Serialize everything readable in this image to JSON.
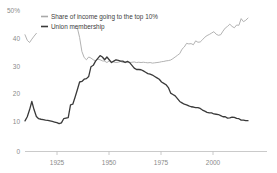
{
  "chart_data": {
    "type": "line",
    "title": "",
    "subtitle": "",
    "xlabel": "",
    "ylabel": "",
    "xlim": [
      1917,
      2015
    ],
    "ylim": [
      0,
      50
    ],
    "grid": false,
    "legend_position": "top-left",
    "y_ticks": [
      {
        "value": 50,
        "label": "50%"
      },
      {
        "value": 40,
        "label": "40"
      },
      {
        "value": 30,
        "label": "30"
      },
      {
        "value": 20,
        "label": "20"
      },
      {
        "value": 10,
        "label": "10"
      },
      {
        "value": 0,
        "label": "0"
      }
    ],
    "x_ticks": [
      {
        "value": 1925,
        "label": "1925"
      },
      {
        "value": 1950,
        "label": "1950"
      },
      {
        "value": 1975,
        "label": "1975"
      },
      {
        "value": 2000,
        "label": "2000"
      }
    ],
    "series": [
      {
        "name": "Share of income going to the top 10%",
        "color": "#a9a9a9",
        "x": [
          1917,
          1918,
          1919,
          1920,
          1921,
          1922,
          1940,
          1941,
          1942,
          1943,
          1944,
          1945,
          1946,
          1947,
          1948,
          1949,
          1950,
          1951,
          1952,
          1953,
          1954,
          1955,
          1956,
          1957,
          1958,
          1959,
          1960,
          1961,
          1962,
          1963,
          1964,
          1965,
          1966,
          1967,
          1968,
          1969,
          1970,
          1971,
          1972,
          1973,
          1974,
          1975,
          1976,
          1977,
          1978,
          1979,
          1980,
          1981,
          1982,
          1983,
          1984,
          1985,
          1986,
          1987,
          1988,
          1989,
          1990,
          1991,
          1992,
          1993,
          1994,
          1995,
          1996,
          1997,
          1998,
          1999,
          2000,
          2001,
          2002,
          2003,
          2004,
          2005,
          2006,
          2007,
          2008,
          2009,
          2010,
          2011,
          2012,
          2013,
          2014,
          2015
        ],
        "y": [
          42.0,
          40.0,
          39.2,
          40.4,
          41.5,
          42.5,
          44.5,
          41.0,
          36.0,
          33.8,
          33.0,
          34.0,
          33.6,
          33.0,
          32.6,
          33.2,
          33.0,
          32.6,
          32.5,
          32.0,
          32.6,
          32.4,
          32.2,
          32.0,
          32.1,
          32.4,
          32.0,
          32.3,
          32.0,
          32.0,
          32.1,
          32.2,
          32.0,
          32.1,
          32.0,
          32.1,
          32.0,
          31.9,
          32.0,
          31.8,
          31.9,
          32.0,
          32.1,
          32.3,
          32.4,
          32.6,
          32.7,
          32.9,
          33.4,
          34.0,
          34.6,
          35.2,
          36.8,
          37.6,
          38.9,
          38.7,
          38.8,
          38.4,
          39.8,
          39.3,
          39.4,
          40.2,
          41.1,
          41.7,
          42.1,
          42.6,
          43.1,
          42.2,
          41.8,
          42.0,
          43.3,
          44.4,
          45.0,
          45.8,
          45.0,
          44.5,
          45.5,
          45.4,
          47.8,
          46.7,
          47.2,
          48.0
        ]
      },
      {
        "name": "Union membership",
        "color": "#3a3a3a",
        "x": [
          1917,
          1918,
          1919,
          1920,
          1921,
          1922,
          1923,
          1924,
          1925,
          1926,
          1927,
          1928,
          1929,
          1930,
          1931,
          1932,
          1933,
          1934,
          1935,
          1936,
          1937,
          1938,
          1939,
          1940,
          1941,
          1942,
          1943,
          1944,
          1945,
          1946,
          1947,
          1948,
          1949,
          1950,
          1951,
          1952,
          1953,
          1954,
          1955,
          1956,
          1957,
          1958,
          1959,
          1960,
          1961,
          1962,
          1963,
          1964,
          1965,
          1966,
          1967,
          1968,
          1969,
          1970,
          1971,
          1972,
          1973,
          1974,
          1975,
          1976,
          1977,
          1978,
          1979,
          1980,
          1981,
          1982,
          1983,
          1984,
          1985,
          1986,
          1987,
          1988,
          1989,
          1990,
          1991,
          1992,
          1993,
          1994,
          1995,
          1996,
          1997,
          1998,
          1999,
          2000,
          2001,
          2002,
          2003,
          2004,
          2005,
          2006,
          2007,
          2008,
          2009,
          2010,
          2011,
          2012,
          2013,
          2014,
          2015
        ],
        "y": [
          11.0,
          12.5,
          15.0,
          18.0,
          15.0,
          12.6,
          11.8,
          11.6,
          11.5,
          11.3,
          11.2,
          11.0,
          10.8,
          10.6,
          10.4,
          10.0,
          10.3,
          11.8,
          12.0,
          12.2,
          16.8,
          17.0,
          19.5,
          22.2,
          25.0,
          25.2,
          26.0,
          26.2,
          27.0,
          30.5,
          31.0,
          32.5,
          33.5,
          34.5,
          34.0,
          33.0,
          34.0,
          33.0,
          32.0,
          32.5,
          33.0,
          32.8,
          32.5,
          32.5,
          32.0,
          32.4,
          32.0,
          31.0,
          30.0,
          29.5,
          29.5,
          29.4,
          29.0,
          28.5,
          28.0,
          27.8,
          27.5,
          27.0,
          26.5,
          26.0,
          25.0,
          24.5,
          24.0,
          23.0,
          21.0,
          20.5,
          20.0,
          19.0,
          18.0,
          17.5,
          17.0,
          16.8,
          16.4,
          16.1,
          16.0,
          15.8,
          15.8,
          15.5,
          14.9,
          14.5,
          14.1,
          13.9,
          13.9,
          13.5,
          13.4,
          13.3,
          12.9,
          12.5,
          12.5,
          12.0,
          12.1,
          12.4,
          12.3,
          11.9,
          11.8,
          11.3,
          11.3,
          11.1,
          11.1
        ]
      }
    ]
  },
  "legend": {
    "items": [
      {
        "label": "Share of income going to the top 10%",
        "color": "#a9a9a9"
      },
      {
        "label": "Union membership",
        "color": "#3a3a3a"
      }
    ]
  }
}
